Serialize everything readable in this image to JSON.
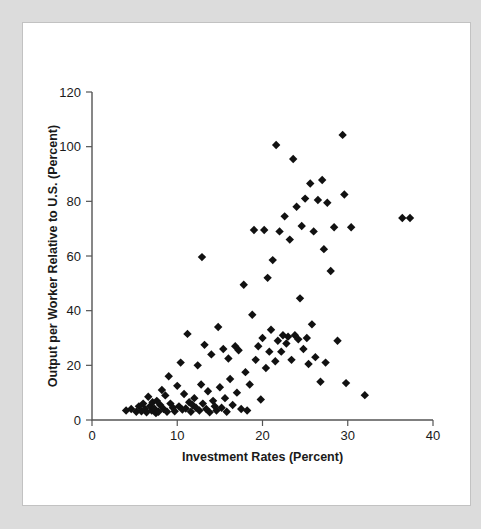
{
  "figure": {
    "frame_color": "#dcdcdc",
    "panel_color": "#ffffff",
    "marker_color": "#111111",
    "axis_color": "#555555"
  },
  "chart_data": {
    "type": "scatter",
    "title": "",
    "xlabel": "Investment Rates (Percent)",
    "ylabel": "Output per Worker Relative to U.S. (Percent)",
    "xlim": [
      0,
      40
    ],
    "ylim": [
      0,
      120
    ],
    "xticks": [
      0,
      10,
      20,
      30,
      40
    ],
    "yticks": [
      0,
      20,
      40,
      60,
      80,
      100,
      120
    ],
    "grid": false,
    "legend": null,
    "marker": "diamond",
    "marker_color": "#111111",
    "series": [
      {
        "name": "Countries",
        "points": [
          [
            4.0,
            3.5
          ],
          [
            4.6,
            4.0
          ],
          [
            5.2,
            3.0
          ],
          [
            5.5,
            5.0
          ],
          [
            5.8,
            3.2
          ],
          [
            6.0,
            6.0
          ],
          [
            6.2,
            4.0
          ],
          [
            6.4,
            2.8
          ],
          [
            6.6,
            8.5
          ],
          [
            6.8,
            5.0
          ],
          [
            7.0,
            3.5
          ],
          [
            7.1,
            6.5
          ],
          [
            7.3,
            4.2
          ],
          [
            7.5,
            2.5
          ],
          [
            7.6,
            7.0
          ],
          [
            7.8,
            3.0
          ],
          [
            8.0,
            5.5
          ],
          [
            8.2,
            11.0
          ],
          [
            8.4,
            4.0
          ],
          [
            8.6,
            9.0
          ],
          [
            8.8,
            3.0
          ],
          [
            9.0,
            16.0
          ],
          [
            9.2,
            6.0
          ],
          [
            9.5,
            4.5
          ],
          [
            9.7,
            3.2
          ],
          [
            10.0,
            12.5
          ],
          [
            10.2,
            5.0
          ],
          [
            10.4,
            21.0
          ],
          [
            10.6,
            3.8
          ],
          [
            10.8,
            9.5
          ],
          [
            11.0,
            4.2
          ],
          [
            11.2,
            31.5
          ],
          [
            11.4,
            6.5
          ],
          [
            11.6,
            3.0
          ],
          [
            11.8,
            5.5
          ],
          [
            12.0,
            8.0
          ],
          [
            12.2,
            4.5
          ],
          [
            12.4,
            20.0
          ],
          [
            12.6,
            3.5
          ],
          [
            12.8,
            13.0
          ],
          [
            12.9,
            59.6
          ],
          [
            13.0,
            6.0
          ],
          [
            13.2,
            27.5
          ],
          [
            13.4,
            4.0
          ],
          [
            13.6,
            10.5
          ],
          [
            13.8,
            2.8
          ],
          [
            14.0,
            24.0
          ],
          [
            14.2,
            7.0
          ],
          [
            14.4,
            5.0
          ],
          [
            14.6,
            3.5
          ],
          [
            14.8,
            34.0
          ],
          [
            15.0,
            12.0
          ],
          [
            15.2,
            4.5
          ],
          [
            15.4,
            26.0
          ],
          [
            15.6,
            8.0
          ],
          [
            15.8,
            3.0
          ],
          [
            16.0,
            22.5
          ],
          [
            16.2,
            15.0
          ],
          [
            16.5,
            5.5
          ],
          [
            16.8,
            27.0
          ],
          [
            17.0,
            10.0
          ],
          [
            17.2,
            25.5
          ],
          [
            17.5,
            4.0
          ],
          [
            17.8,
            49.5
          ],
          [
            18.0,
            17.5
          ],
          [
            18.2,
            3.5
          ],
          [
            18.5,
            13.0
          ],
          [
            18.8,
            38.5
          ],
          [
            19.0,
            69.5
          ],
          [
            19.2,
            22.0
          ],
          [
            19.5,
            27.0
          ],
          [
            19.8,
            7.5
          ],
          [
            20.0,
            30.0
          ],
          [
            20.2,
            69.5
          ],
          [
            20.4,
            19.0
          ],
          [
            20.6,
            52.0
          ],
          [
            20.8,
            25.0
          ],
          [
            21.0,
            33.0
          ],
          [
            21.2,
            58.5
          ],
          [
            21.5,
            21.5
          ],
          [
            21.6,
            100.6
          ],
          [
            21.8,
            29.0
          ],
          [
            22.0,
            69.0
          ],
          [
            22.2,
            25.0
          ],
          [
            22.4,
            31.0
          ],
          [
            22.6,
            74.5
          ],
          [
            22.8,
            28.0
          ],
          [
            23.0,
            30.5
          ],
          [
            23.2,
            66.0
          ],
          [
            23.4,
            22.0
          ],
          [
            23.6,
            95.5
          ],
          [
            23.8,
            31.0
          ],
          [
            24.0,
            78.0
          ],
          [
            24.2,
            29.5
          ],
          [
            24.4,
            44.5
          ],
          [
            24.6,
            71.0
          ],
          [
            24.8,
            26.0
          ],
          [
            25.0,
            81.0
          ],
          [
            25.2,
            30.0
          ],
          [
            25.4,
            20.5
          ],
          [
            25.6,
            86.5
          ],
          [
            25.8,
            35.0
          ],
          [
            26.0,
            69.0
          ],
          [
            26.2,
            23.0
          ],
          [
            26.5,
            80.5
          ],
          [
            26.8,
            14.0
          ],
          [
            27.0,
            87.8
          ],
          [
            27.2,
            62.5
          ],
          [
            27.4,
            21.0
          ],
          [
            27.6,
            79.5
          ],
          [
            28.0,
            54.5
          ],
          [
            28.4,
            70.5
          ],
          [
            28.8,
            29.0
          ],
          [
            29.4,
            104.3
          ],
          [
            29.6,
            82.5
          ],
          [
            29.8,
            13.5
          ],
          [
            30.4,
            70.5
          ],
          [
            32.0,
            9.1
          ],
          [
            36.4,
            73.9
          ],
          [
            37.3,
            73.9
          ]
        ]
      }
    ]
  }
}
